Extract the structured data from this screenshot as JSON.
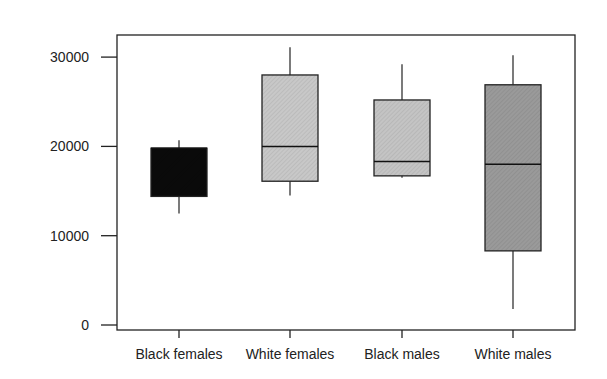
{
  "chart_data": {
    "type": "box",
    "title": "",
    "xlabel": "",
    "ylabel": "",
    "ylim": [
      -600,
      32500
    ],
    "yticks": [
      0,
      10000,
      20000,
      30000
    ],
    "ytick_labels": [
      "0",
      "10000",
      "20000",
      "30000"
    ],
    "grid": false,
    "legend": null,
    "categories": [
      "Black females",
      "White females",
      "Black males",
      "White males"
    ],
    "series": [
      {
        "name": "Black females",
        "min": 12500,
        "q1": 14400,
        "median": 19800,
        "q3": 19800,
        "max": 20700,
        "fill": "#0a0a0a"
      },
      {
        "name": "White females",
        "min": 14500,
        "q1": 16100,
        "median": 20000,
        "q3": 28000,
        "max": 31100,
        "fill": "#c8c8c8"
      },
      {
        "name": "Black males",
        "min": 16500,
        "q1": 16700,
        "median": 18300,
        "q3": 25200,
        "max": 29200,
        "fill": "#c4c4c4"
      },
      {
        "name": "White males",
        "min": 1800,
        "q1": 8300,
        "median": 18000,
        "q3": 26900,
        "max": 30200,
        "fill": "#9a9a9a"
      }
    ]
  }
}
